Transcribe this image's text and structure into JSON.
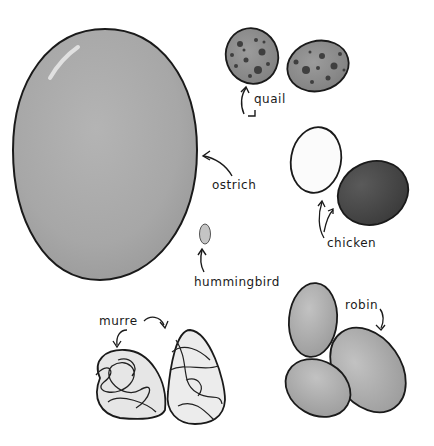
{
  "illustration": {
    "background": "#ffffff",
    "outline_color": "#1a1a1a",
    "eggs": [
      {
        "id": "ostrich",
        "label": "ostrich",
        "fill": "#a9a9a9",
        "count": 1
      },
      {
        "id": "hummingbird",
        "label": "hummingbird",
        "fill": "#c4c4c4",
        "count": 1
      },
      {
        "id": "quail",
        "label": "quail",
        "fill": "#8e8e8e",
        "spot_color": "#3f3f3f",
        "count": 2
      },
      {
        "id": "chicken",
        "label": "chicken",
        "fills": [
          "#fbfbfb",
          "#4a4a4a"
        ],
        "count": 2
      },
      {
        "id": "murre",
        "label": "murre",
        "fill": "#e6e6e6",
        "scribble_color": "#222222",
        "count": 2
      },
      {
        "id": "robin",
        "label": "robin",
        "fill": "#acacac",
        "count": 3
      }
    ]
  }
}
